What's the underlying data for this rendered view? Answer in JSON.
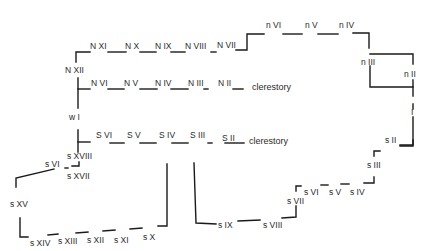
{
  "diagram": {
    "type": "church window plan",
    "north_aisle": {
      "labels": [
        "N XII",
        "N XI",
        "N X",
        "N IX",
        "N VIII",
        "N VII"
      ]
    },
    "north_clerestory": {
      "labels": [
        "N VI",
        "N V",
        "N IV",
        "N III",
        "N II"
      ],
      "caption": "clerestory"
    },
    "north_choir": {
      "labels": [
        "n VI",
        "n V",
        "n IV",
        "n III",
        "n II"
      ]
    },
    "east": {
      "label": "I"
    },
    "west": {
      "label": "w I"
    },
    "south_clerestory": {
      "labels": [
        "S VI",
        "S V",
        "S IV",
        "S III",
        "S II"
      ],
      "caption": "clerestory"
    },
    "south_chapel": {
      "labels": [
        "s XVIII",
        "s VI",
        "s XVII",
        "s XV",
        "s XIV",
        "s XIII",
        "s XII",
        "s XI",
        "s X"
      ]
    },
    "south_choir": {
      "labels": [
        "s IX",
        "s VIII",
        "s VII",
        "s VI",
        "s V",
        "s IV",
        "s III",
        "s II"
      ]
    }
  }
}
